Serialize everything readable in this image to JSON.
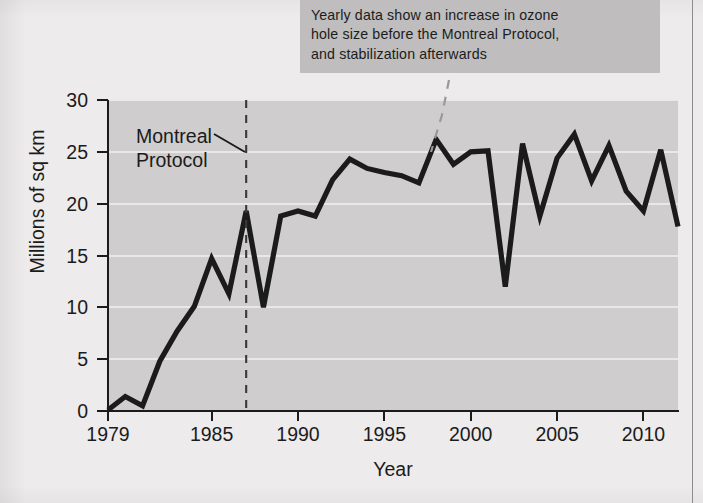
{
  "callout": {
    "lines": [
      "Yearly data show an increase in ozone",
      "hole size before the Montreal Protocol,",
      "and stabilization afterwards"
    ]
  },
  "annotations": {
    "montreal_protocol": {
      "line1": "Montreal",
      "line2": "Protocol",
      "year": 1987
    }
  },
  "colors": {
    "page_background": "#edebeb",
    "plot_background": "#cfcdcd",
    "callout_background": "#bfbdbd",
    "gridline": "#eceaea",
    "axis": "#1b1b1b",
    "series_line": "#1b1b1b",
    "text": "#1c1c1c",
    "leader_line": "#9a9898"
  },
  "chart_data": {
    "type": "line",
    "title": "",
    "xlabel": "Year",
    "ylabel": "Millions of sq km",
    "xlim": [
      1979,
      2012
    ],
    "ylim": [
      0,
      30
    ],
    "grid": true,
    "legend": "none",
    "xticks": [
      1979,
      1985,
      1990,
      1995,
      2000,
      2005,
      2010
    ],
    "xtick_labels": [
      "1979",
      "1985",
      "1990",
      "1995",
      "2000",
      "2005",
      "2010"
    ],
    "yticks": [
      0,
      5,
      10,
      15,
      20,
      25,
      30
    ],
    "ytick_labels": [
      "0",
      "5",
      "10",
      "15",
      "20",
      "25",
      "30"
    ],
    "x": [
      1979,
      1980,
      1981,
      1982,
      1983,
      1984,
      1985,
      1986,
      1987,
      1988,
      1989,
      1990,
      1991,
      1992,
      1993,
      1994,
      1995,
      1996,
      1997,
      1998,
      1999,
      2000,
      2001,
      2002,
      2003,
      2004,
      2005,
      2006,
      2007,
      2008,
      2009,
      2010,
      2011,
      2012
    ],
    "values": [
      0.1,
      1.4,
      0.5,
      4.8,
      7.7,
      10.1,
      14.7,
      11.3,
      19.3,
      10.0,
      18.8,
      19.3,
      18.8,
      22.3,
      24.3,
      23.4,
      23.0,
      22.7,
      22.0,
      26.2,
      23.8,
      25.0,
      25.1,
      12.0,
      25.8,
      18.8,
      24.4,
      26.7,
      22.2,
      25.6,
      21.2,
      19.3,
      25.2,
      17.8
    ],
    "series_name": "Antarctic ozone hole area"
  }
}
